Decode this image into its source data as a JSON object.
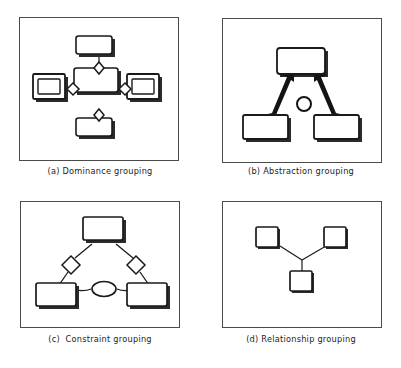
{
  "figure": {
    "title": "",
    "background_color": "#ffffff",
    "ink_color": "#1a1a1a",
    "frame_color": "#4a4a4a",
    "shadow_color": "#2b2b2b",
    "panel_count": 4
  },
  "panels": [
    {
      "id": "a",
      "label": "(a)",
      "name": "Dominance grouping",
      "caption": "(a) Dominance grouping",
      "description": "A central rectangle with four connectors radiating up, down, left and right; each connector carries a small diamond. Top and bottom connect to plain rectangles, left and right connect to nested double rectangles.",
      "node_count": 5,
      "link_count": 4,
      "decorator": "diamond",
      "nodes": [
        {
          "name": "center-box",
          "shape": "rectangle",
          "nested": false
        },
        {
          "name": "top-box",
          "shape": "rectangle",
          "nested": false
        },
        {
          "name": "bottom-box",
          "shape": "rectangle",
          "nested": false
        },
        {
          "name": "left-box",
          "shape": "rectangle",
          "nested": true
        },
        {
          "name": "right-box",
          "shape": "rectangle",
          "nested": true
        }
      ]
    },
    {
      "id": "b",
      "label": "(b)",
      "name": "Abstraction grouping",
      "caption": "(b) Abstraction grouping",
      "description": "Two lower rectangles connected by thick tapered arrows pointing up to a single upper rectangle; a small circle sits on the arc joining the two arrows.",
      "node_count": 3,
      "link_count": 2,
      "decorator": "arrow",
      "nodes": [
        {
          "name": "top-box",
          "shape": "rectangle",
          "nested": false
        },
        {
          "name": "bottom-left-box",
          "shape": "rectangle",
          "nested": false
        },
        {
          "name": "bottom-right-box",
          "shape": "rectangle",
          "nested": false
        }
      ]
    },
    {
      "id": "c",
      "label": "(c)",
      "name": "Constraint grouping",
      "caption": "(c)  Constraint grouping",
      "description": "An upper rectangle linked by two diagonal lines, each carrying a diamond, down to two lower rectangles; an ellipse joins the two lower links at the centre.",
      "node_count": 3,
      "link_count": 2,
      "decorator": "diamond",
      "nodes": [
        {
          "name": "top-box",
          "shape": "rectangle",
          "nested": false
        },
        {
          "name": "bottom-left-box",
          "shape": "rectangle",
          "nested": false
        },
        {
          "name": "bottom-right-box",
          "shape": "rectangle",
          "nested": false
        }
      ]
    },
    {
      "id": "d",
      "label": "(d)",
      "name": "Relationship grouping",
      "caption": "(d) Relationship grouping",
      "description": "Three small squares arranged in a Y, joined by thin plain lines meeting at a central junction.",
      "node_count": 3,
      "link_count": 3,
      "decorator": "none",
      "nodes": [
        {
          "name": "top-left-box",
          "shape": "square",
          "nested": false
        },
        {
          "name": "top-right-box",
          "shape": "square",
          "nested": false
        },
        {
          "name": "bottom-box",
          "shape": "square",
          "nested": false
        }
      ]
    }
  ]
}
